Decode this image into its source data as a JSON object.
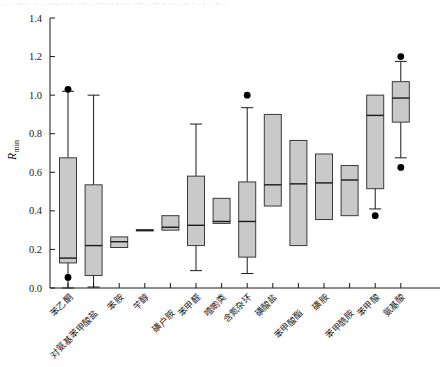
{
  "figure": {
    "name": "boxplot-rmin-by-compound-class",
    "background": "#ffffff",
    "box_fill": "#c9c9c9",
    "box_stroke": "#3a3a3a",
    "line_color": "#1a1a1a",
    "top_bleed_text": "—  –  ••  •—•  —••—•• •—•• —••—• •—•—•• —•• •—•—•• •—•— •—"
  },
  "chart_data": {
    "type": "box",
    "title": "",
    "xlabel": "",
    "ylabel": "R_min",
    "ylabel_base": "R",
    "ylabel_subscript": "min",
    "ylim": [
      0.0,
      1.4
    ],
    "ytick_values": [
      0.0,
      0.2,
      0.4,
      0.6,
      0.8,
      1.0,
      1.2,
      1.4
    ],
    "ytick_labels": [
      "0.0",
      "0.2",
      "0.4",
      "0.6",
      "0.8",
      "1.0",
      "1.2",
      "1.4"
    ],
    "grid": false,
    "legend": "none",
    "categories": [
      "苯乙酮",
      "对氨基苯甲酸盐",
      "苯胺",
      "苄醇",
      "磺户胺",
      "苯甲醛",
      "噎啲类",
      "含氮杂环",
      "磺酸盐",
      "苯甲酸酯",
      "磺胺",
      "苯甲酰胺",
      "苯甲酸",
      "氨基酸"
    ],
    "boxes": [
      {
        "category": "苯乙酮",
        "whisker_low": 0.0,
        "q1": 0.13,
        "median": 0.155,
        "q3": 0.675,
        "whisker_high": 1.02,
        "outliers": [
          1.03,
          0.055
        ]
      },
      {
        "category": "对氨基苯甲酸盐",
        "whisker_low": 0.005,
        "q1": 0.065,
        "median": 0.22,
        "q3": 0.535,
        "whisker_high": 1.0,
        "outliers": []
      },
      {
        "category": "苯胺",
        "whisker_low": null,
        "q1": 0.21,
        "median": 0.24,
        "q3": 0.265,
        "whisker_high": null,
        "outliers": []
      },
      {
        "category": "苄醇",
        "whisker_low": null,
        "q1": 0.298,
        "median": 0.3,
        "q3": 0.302,
        "whisker_high": null,
        "outliers": []
      },
      {
        "category": "磺户胺",
        "whisker_low": null,
        "q1": 0.3,
        "median": 0.315,
        "q3": 0.375,
        "whisker_high": null,
        "outliers": []
      },
      {
        "category": "苯甲醛",
        "whisker_low": 0.09,
        "q1": 0.22,
        "median": 0.325,
        "q3": 0.58,
        "whisker_high": 0.85,
        "outliers": []
      },
      {
        "category": "噎啲类",
        "whisker_low": null,
        "q1": 0.335,
        "median": 0.345,
        "q3": 0.465,
        "whisker_high": null,
        "outliers": []
      },
      {
        "category": "含氮杂环",
        "whisker_low": 0.075,
        "q1": 0.16,
        "median": 0.345,
        "q3": 0.55,
        "whisker_high": 0.935,
        "outliers": [
          1.0
        ]
      },
      {
        "category": "磺酸盐",
        "whisker_low": null,
        "q1": 0.425,
        "median": 0.535,
        "q3": 0.9,
        "whisker_high": null,
        "outliers": []
      },
      {
        "category": "苯甲酸酯",
        "whisker_low": null,
        "q1": 0.22,
        "median": 0.54,
        "q3": 0.765,
        "whisker_high": null,
        "outliers": []
      },
      {
        "category": "磺胺",
        "whisker_low": null,
        "q1": 0.355,
        "median": 0.545,
        "q3": 0.695,
        "whisker_high": null,
        "outliers": []
      },
      {
        "category": "苯甲酰胺",
        "whisker_low": null,
        "q1": 0.375,
        "median": 0.56,
        "q3": 0.635,
        "whisker_high": null,
        "outliers": []
      },
      {
        "category": "苯甲酸",
        "whisker_low": 0.41,
        "q1": 0.515,
        "median": 0.895,
        "q3": 1.0,
        "whisker_high": null,
        "outliers": [
          0.375
        ]
      },
      {
        "category": "氨基酸",
        "whisker_low": 0.675,
        "q1": 0.86,
        "median": 0.985,
        "q3": 1.07,
        "whisker_high": 1.175,
        "outliers": [
          1.2,
          0.625
        ]
      }
    ]
  }
}
